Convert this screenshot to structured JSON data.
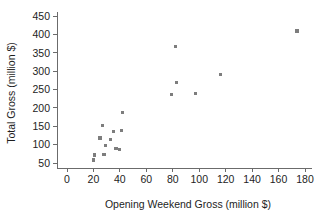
{
  "chart_data": {
    "type": "scatter",
    "title": "",
    "xlabel": "Opening Weekend Gross (million $)",
    "ylabel": "Total Gross (million $)",
    "xlim": [
      0,
      185
    ],
    "ylim": [
      40,
      460
    ],
    "xticks": [
      0,
      20,
      40,
      60,
      80,
      100,
      120,
      140,
      160,
      180
    ],
    "yticks": [
      50,
      100,
      150,
      200,
      250,
      300,
      350,
      400,
      450
    ],
    "grid": false,
    "legend": null,
    "marker_color": "#7d7d7d",
    "marker_shape": "square",
    "axis_color": "#6b6b6b",
    "points": [
      {
        "x": 20,
        "y": 58
      },
      {
        "x": 21,
        "y": 72
      },
      {
        "x": 25,
        "y": 118
      },
      {
        "x": 27,
        "y": 152
      },
      {
        "x": 28,
        "y": 74
      },
      {
        "x": 29,
        "y": 97
      },
      {
        "x": 33,
        "y": 113
      },
      {
        "x": 35,
        "y": 136
      },
      {
        "x": 37,
        "y": 90
      },
      {
        "x": 40,
        "y": 86
      },
      {
        "x": 41,
        "y": 139
      },
      {
        "x": 42,
        "y": 187
      },
      {
        "x": 79,
        "y": 236
      },
      {
        "x": 82,
        "y": 366
      },
      {
        "x": 83,
        "y": 268
      },
      {
        "x": 97,
        "y": 240
      },
      {
        "x": 116,
        "y": 291
      },
      {
        "x": 174,
        "y": 409
      }
    ]
  },
  "axes": {
    "x_title": "Opening Weekend Gross (million $)",
    "y_title": "Total Gross (million $)"
  }
}
